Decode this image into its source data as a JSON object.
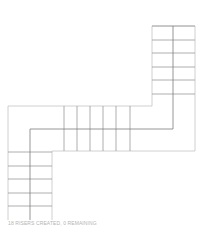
{
  "status_text": "18 RISERS CREATED, 0 REMAINING",
  "colors": {
    "outline": "#c4c4c4",
    "tread": "#9a9a9a",
    "center": "#7c7c7c",
    "status": "#b4b4b4"
  },
  "stair": {
    "outline_path": "M152,26 L195,26 L195,151 L52,151 L52,220 M8,220 L8,106 L152,106 L152,26",
    "walkline_path": "M173,26 L173,129 L30,129 L30,220",
    "top_flight_treads": [
      26,
      40,
      53,
      67,
      80,
      94
    ],
    "top_flight_x": [
      152,
      195
    ],
    "middle_flight_risers": [
      64,
      77,
      90,
      103,
      116,
      130
    ],
    "middle_flight_y": [
      106,
      151
    ],
    "bottom_flight_treads": [
      152,
      166,
      179,
      193,
      206
    ],
    "bottom_flight_x": [
      8,
      52
    ]
  }
}
